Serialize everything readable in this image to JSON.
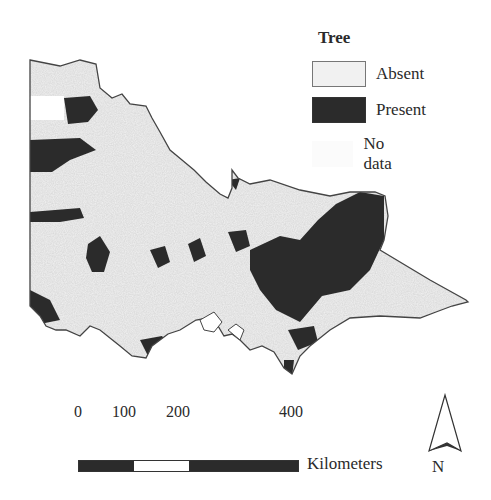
{
  "legend": {
    "title": "Tree",
    "items": [
      {
        "label": "Absent",
        "color": "#f1f1f1"
      },
      {
        "label": "Present",
        "color": "#2b2b2b"
      },
      {
        "label": "No data",
        "color": "#ffffff"
      }
    ]
  },
  "scale_bar": {
    "ticks": [
      "0",
      "100",
      "200",
      "400"
    ],
    "units": "Kilometers"
  },
  "north_arrow": {
    "label": "N"
  }
}
